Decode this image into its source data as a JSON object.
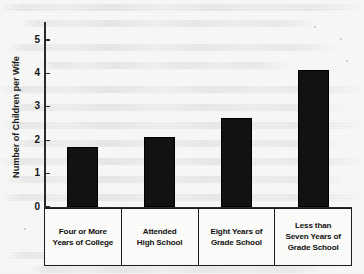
{
  "chart_data": {
    "type": "bar",
    "title": "",
    "xlabel": "",
    "ylabel": "Number of Children per Wife",
    "ylim": [
      0,
      5.5
    ],
    "yticks": [
      "0",
      "1",
      "2",
      "3",
      "4",
      "5"
    ],
    "grid": false,
    "legend": null,
    "categories": [
      "Four or More Years of College",
      "Attended High School",
      "Eight Years of Grade School",
      "Less than Seven Years of Grade School"
    ],
    "category_label_lines": [
      [
        "Four or More",
        "Years of College"
      ],
      [
        "Attended",
        "High School"
      ],
      [
        "Eight Years of",
        "Grade School"
      ],
      [
        "Less than",
        "Seven Years of",
        "Grade School"
      ]
    ],
    "values": [
      1.8,
      2.1,
      2.65,
      4.1
    ],
    "bar_color": "#121212",
    "axis_color": "#2a2a2a"
  }
}
